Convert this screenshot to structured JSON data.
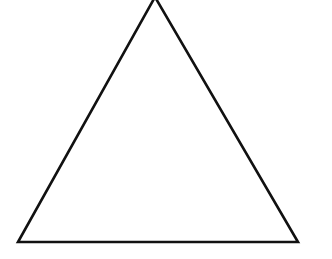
{
  "diagram": {
    "shape": "equilateral-triangle",
    "stroke_color": "#111111",
    "fill_color": "#ffffff",
    "background": "#ffffff",
    "vertices": {
      "apex": [
        155,
        -3
      ],
      "bottom_left": [
        18,
        242
      ],
      "bottom_right": [
        298,
        242
      ]
    }
  }
}
